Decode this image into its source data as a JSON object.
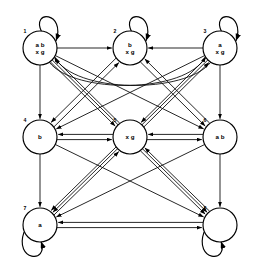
{
  "diagram": {
    "type": "directed-graph",
    "title": "",
    "background_color": "#ffffff",
    "stroke_color": "#000000",
    "node_radius": 17,
    "nodes": [
      {
        "id": "1",
        "index_label": "1",
        "cx": 40,
        "cy": 48,
        "label_lines": [
          "a  b",
          "x g"
        ],
        "self_loop": true,
        "self_loop_position": "top-right"
      },
      {
        "id": "2",
        "index_label": "2",
        "cx": 130,
        "cy": 48,
        "label_lines": [
          "b",
          "x g"
        ],
        "self_loop": true,
        "self_loop_position": "top-right"
      },
      {
        "id": "3",
        "index_label": "3",
        "cx": 220,
        "cy": 48,
        "label_lines": [
          "a",
          "x g"
        ],
        "self_loop": true,
        "self_loop_position": "top-right"
      },
      {
        "id": "4",
        "index_label": "4",
        "cx": 40,
        "cy": 137,
        "label_lines": [
          "b"
        ],
        "self_loop": false,
        "self_loop_position": ""
      },
      {
        "id": "5",
        "index_label": "5",
        "cx": 130,
        "cy": 137,
        "label_lines": [
          "x g"
        ],
        "self_loop": false,
        "self_loop_position": ""
      },
      {
        "id": "6",
        "index_label": "6",
        "cx": 220,
        "cy": 137,
        "label_lines": [
          "a   b"
        ],
        "self_loop": false,
        "self_loop_position": ""
      },
      {
        "id": "7",
        "index_label": "7",
        "cx": 40,
        "cy": 225,
        "label_lines": [
          "a"
        ],
        "self_loop": true,
        "self_loop_position": "bottom-left"
      },
      {
        "id": "8",
        "index_label": "8",
        "cx": 220,
        "cy": 225,
        "label_lines": [],
        "self_loop": true,
        "self_loop_position": "bottom-left"
      }
    ],
    "edges": [
      {
        "from": "1",
        "to": "2",
        "style": "straight"
      },
      {
        "from": "3",
        "to": "2",
        "style": "straight"
      },
      {
        "from": "1",
        "to": "4",
        "style": "straight"
      },
      {
        "from": "3",
        "to": "6",
        "style": "straight"
      },
      {
        "from": "4",
        "to": "5",
        "style": "straight"
      },
      {
        "from": "5",
        "to": "4",
        "style": "straight"
      },
      {
        "from": "5",
        "to": "6",
        "style": "straight"
      },
      {
        "from": "6",
        "to": "5",
        "style": "straight"
      },
      {
        "from": "4",
        "to": "7",
        "style": "straight"
      },
      {
        "from": "6",
        "to": "8",
        "style": "straight"
      },
      {
        "from": "7",
        "to": "8",
        "style": "straight"
      },
      {
        "from": "8",
        "to": "7",
        "style": "straight"
      },
      {
        "from": "2",
        "to": "4",
        "style": "straight"
      },
      {
        "from": "2",
        "to": "6",
        "style": "straight"
      },
      {
        "from": "4",
        "to": "2",
        "style": "straight"
      },
      {
        "from": "6",
        "to": "2",
        "style": "straight"
      },
      {
        "from": "1",
        "to": "5",
        "style": "straight"
      },
      {
        "from": "5",
        "to": "1",
        "style": "straight"
      },
      {
        "from": "3",
        "to": "5",
        "style": "straight"
      },
      {
        "from": "5",
        "to": "3",
        "style": "straight"
      },
      {
        "from": "1",
        "to": "6",
        "style": "straight"
      },
      {
        "from": "3",
        "to": "4",
        "style": "straight"
      },
      {
        "from": "1",
        "to": "8",
        "style": "straight"
      },
      {
        "from": "3",
        "to": "7",
        "style": "straight"
      },
      {
        "from": "4",
        "to": "8",
        "style": "straight"
      },
      {
        "from": "6",
        "to": "7",
        "style": "straight"
      },
      {
        "from": "5",
        "to": "7",
        "style": "straight"
      },
      {
        "from": "5",
        "to": "8",
        "style": "straight"
      },
      {
        "from": "7",
        "to": "5",
        "style": "straight"
      },
      {
        "from": "8",
        "to": "5",
        "style": "straight"
      },
      {
        "from": "1",
        "to": "3",
        "style": "curved-long"
      },
      {
        "from": "3",
        "to": "1",
        "style": "curved-long"
      },
      {
        "from": "1",
        "to": "1",
        "style": "self"
      },
      {
        "from": "2",
        "to": "2",
        "style": "self"
      },
      {
        "from": "3",
        "to": "3",
        "style": "self"
      },
      {
        "from": "7",
        "to": "7",
        "style": "self"
      },
      {
        "from": "8",
        "to": "8",
        "style": "self"
      }
    ]
  }
}
